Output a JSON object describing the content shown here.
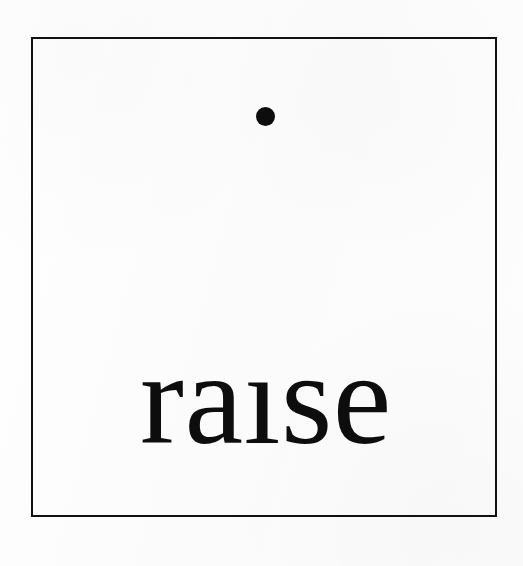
{
  "artwork": {
    "title": "raise",
    "word_displayed": "raısı",
    "word_read_as": "raise",
    "word_with_dotless_i": "raıse",
    "concept": "the dot of the letter i has been raised to the top of the frame",
    "typeface_style": "serif",
    "canvas": {
      "width": 523,
      "height": 566,
      "background_color": "#fcfcfc"
    },
    "frame": {
      "name": "square-border",
      "stroke_color": "#111111",
      "stroke_width": 2,
      "x": 31,
      "y": 37,
      "width": 466,
      "height": 480
    },
    "dot": {
      "name": "raised-i-dot",
      "shape": "circle",
      "fill_color": "#0d0d0d",
      "center_x": 265,
      "center_y": 117,
      "diameter": 19
    },
    "text": {
      "value": "raıse",
      "color": "#0d0d0d",
      "font_size": 132,
      "left": 95,
      "right": 443,
      "baseline_y": 445
    }
  }
}
